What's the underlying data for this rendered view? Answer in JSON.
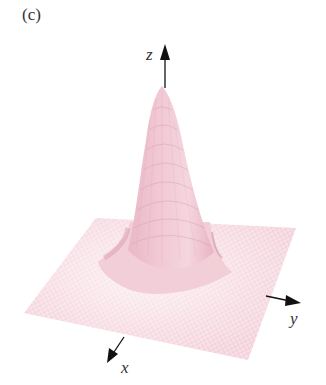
{
  "figure": {
    "panel_label": "(c)",
    "axes": {
      "z": "z",
      "y": "y",
      "x": "x"
    },
    "colors": {
      "surface": "#f2c9d4",
      "surface_shadow": "#d9a3b3",
      "mesh_line": "#e8a8ba",
      "axis": "#111111",
      "background": "#ffffff"
    }
  }
}
